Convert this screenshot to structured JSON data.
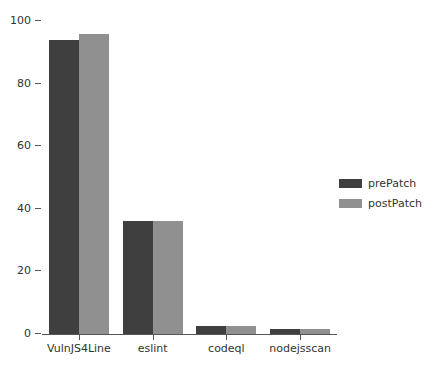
{
  "chart_data": {
    "type": "bar",
    "title": "",
    "xlabel": "",
    "ylabel": "",
    "categories": [
      "VulnJS4Line",
      "eslint",
      "codeql",
      "nodejsscan"
    ],
    "series": [
      {
        "name": "prePatch",
        "color": "#3f3f3f",
        "values": [
          94,
          36,
          2.7,
          1.6
        ]
      },
      {
        "name": "postPatch",
        "color": "#909090",
        "values": [
          96,
          36,
          2.7,
          1.6
        ]
      }
    ],
    "ylim": [
      0,
      100
    ],
    "yticks": [
      0,
      20,
      40,
      60,
      80,
      100
    ],
    "ytick_labels": [
      "0",
      "20",
      "40",
      "60",
      "80",
      "100"
    ],
    "grid": false,
    "legend_position": "center right"
  },
  "legend": {
    "entries": [
      {
        "label": "prePatch",
        "swatch": "pre"
      },
      {
        "label": "postPatch",
        "swatch": "post"
      }
    ]
  },
  "axis": {
    "tick_color": "#555555",
    "label_color": "#33332f"
  }
}
